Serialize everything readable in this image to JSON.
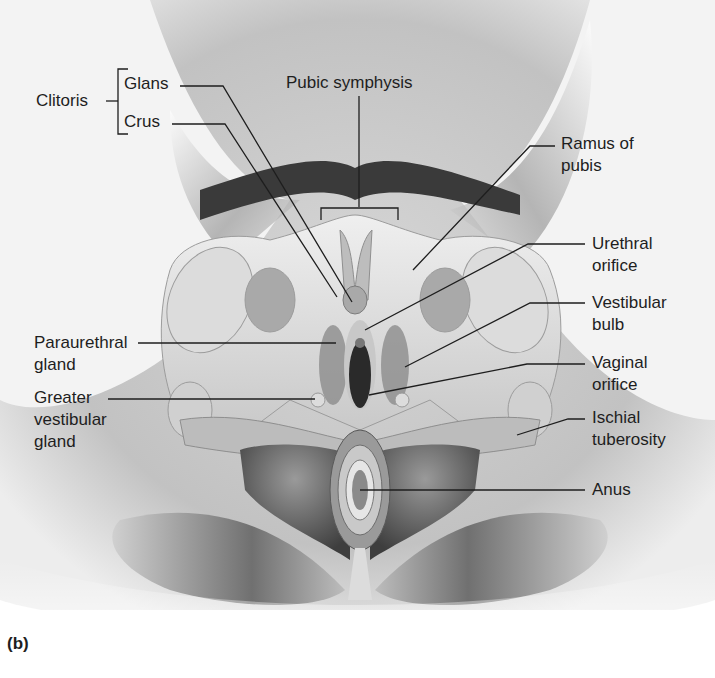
{
  "figure": {
    "panel_label": "(b)",
    "group_label": "Clitoris",
    "labels": {
      "glans": "Glans",
      "crus": "Crus",
      "pubic_symphysis": "Pubic symphysis",
      "ramus_line1": "Ramus of",
      "ramus_line2": "pubis",
      "urethral_line1": "Urethral",
      "urethral_line2": "orifice",
      "vestibular_bulb_line1": "Vestibular",
      "vestibular_bulb_line2": "bulb",
      "vaginal_line1": "Vaginal",
      "vaginal_line2": "orifice",
      "ischial_line1": "Ischial",
      "ischial_line2": "tuberosity",
      "anus": "Anus",
      "paraurethral_line1": "Paraurethral",
      "paraurethral_line2": "gland",
      "greater_line1": "Greater",
      "greater_line2": "vestibular",
      "greater_line3": "gland"
    }
  }
}
